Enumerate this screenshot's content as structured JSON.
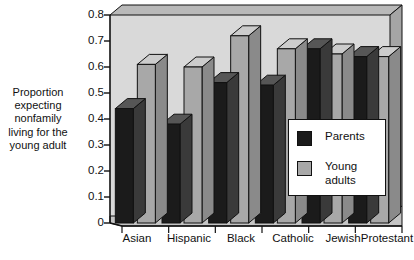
{
  "chart_data": {
    "type": "bar",
    "title": "",
    "subtitle": "",
    "xlabel": "",
    "ylabel": "Proportion expecting nonfamily living for the young adult",
    "ylabel_lines": [
      "Proportion",
      "expecting",
      "nonfamily",
      "living for the",
      "young adult"
    ],
    "categories": [
      "Asian",
      "Hispanic",
      "Black",
      "Catholic",
      "Jewish",
      "Protestant"
    ],
    "series": [
      {
        "name": "Parents",
        "values": [
          0.44,
          0.38,
          0.54,
          0.53,
          0.67,
          0.64
        ],
        "color": "#1b1b1b"
      },
      {
        "name": "Young adults",
        "values": [
          0.61,
          0.6,
          0.72,
          0.67,
          0.65,
          0.64
        ],
        "color": "#a8a8a8"
      }
    ],
    "ylim": [
      0,
      0.8
    ],
    "ytick_values": [
      0,
      0.1,
      0.2,
      0.3,
      0.4,
      0.5,
      0.6,
      0.7,
      0.8
    ],
    "ytick_labels": [
      "0",
      "0.1",
      "0.2",
      "0.3",
      "0.4",
      "0.5",
      "0.6",
      "0.7",
      "0.8"
    ],
    "grid": false,
    "three_d": true,
    "legend_position": "inside-right",
    "plot_background": "#d8d8d8"
  },
  "legend": {
    "entries": [
      {
        "label": "Parents",
        "swatch_color": "#1b1b1b"
      },
      {
        "label": "Young\nadults",
        "swatch_color": "#a8a8a8"
      }
    ]
  },
  "colors": {
    "parents": "#1b1b1b",
    "parents_side": "#3a3a3a",
    "parents_top": "#565656",
    "young": "#a8a8a8",
    "young_side": "#8a8a8a",
    "young_top": "#cccccc",
    "plot_floor": "#c2c2c2",
    "plot_back": "#d8d8d8",
    "plot_wall": "#9c9c9c",
    "axis": "#111111",
    "text": "#111111",
    "page_background": "#ffffff"
  }
}
